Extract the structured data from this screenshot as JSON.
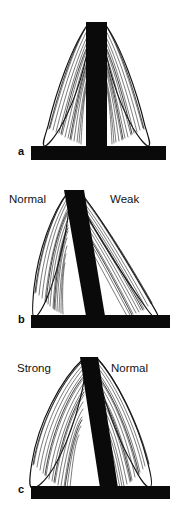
{
  "figure": {
    "background_color": "#ffffff",
    "ink_color": "#0a0a0a",
    "panel_count": 3
  },
  "panels": [
    {
      "letter": "a",
      "condition": "balanced",
      "post_orientation": "vertical",
      "labels": {
        "left": "",
        "right": ""
      },
      "muscles": [
        {
          "side": "left",
          "state": "normal",
          "label": ""
        },
        {
          "side": "right",
          "state": "normal",
          "label": ""
        }
      ]
    },
    {
      "letter": "b",
      "condition": "imbalanced-tilt-right",
      "post_orientation": "tilted",
      "labels": {
        "left": "Normal",
        "right": "Weak"
      },
      "muscles": [
        {
          "side": "left",
          "state": "normal",
          "label": "Normal"
        },
        {
          "side": "right",
          "state": "weak",
          "label": "Weak"
        }
      ]
    },
    {
      "letter": "c",
      "condition": "imbalanced-pull-left",
      "post_orientation": "tilted",
      "labels": {
        "left": "Strong",
        "right": "Normal"
      },
      "muscles": [
        {
          "side": "left",
          "state": "strong",
          "label": "Strong"
        },
        {
          "side": "right",
          "state": "normal",
          "label": "Normal"
        }
      ]
    }
  ],
  "icons": {
    "post": "vertical-post-shape",
    "base": "horizontal-base-bar-shape",
    "muscle": "spindle-muscle-shape"
  }
}
